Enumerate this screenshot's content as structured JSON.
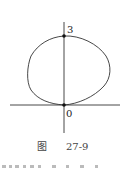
{
  "figure": {
    "caption_prefix": "图",
    "caption_number": "27-9",
    "point_labels": {
      "top": "3",
      "origin": "0"
    },
    "colors": {
      "stroke": "#333333",
      "background": "#ffffff"
    }
  }
}
